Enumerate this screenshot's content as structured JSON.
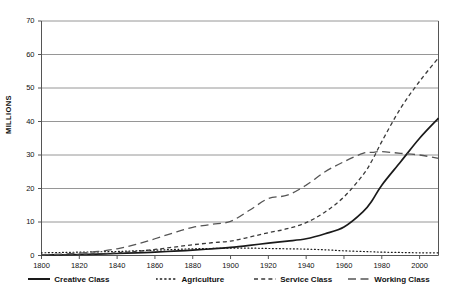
{
  "chart_data": {
    "type": "line",
    "title": "",
    "subtitle": "",
    "xlabel": "",
    "ylabel": "MILLIONS",
    "xlim": [
      1800,
      2010
    ],
    "ylim": [
      0,
      70
    ],
    "grid": true,
    "legend_position": "bottom",
    "xticks": [
      1800,
      1820,
      1840,
      1860,
      1880,
      1900,
      1920,
      1940,
      1960,
      1980,
      2000
    ],
    "yticks": [
      0,
      10,
      20,
      30,
      40,
      50,
      60,
      70
    ],
    "x": [
      1800,
      1810,
      1820,
      1830,
      1840,
      1850,
      1860,
      1870,
      1880,
      1890,
      1900,
      1910,
      1920,
      1930,
      1940,
      1950,
      1960,
      1970,
      1975,
      1980,
      1990,
      2000,
      2010
    ],
    "series": [
      {
        "name": "Creative Class",
        "style": "solid",
        "color": "#1a1a1a",
        "values": [
          0.1,
          0.2,
          0.3,
          0.4,
          0.6,
          0.8,
          1.0,
          1.3,
          1.6,
          2.0,
          2.4,
          3.0,
          3.7,
          4.3,
          5.0,
          6.5,
          8.5,
          13.0,
          16.5,
          21.0,
          28.0,
          35.0,
          41.0
        ]
      },
      {
        "name": "Agriculture",
        "style": "dotted",
        "color": "#1a1a1a",
        "values": [
          0.8,
          0.9,
          1.0,
          1.1,
          1.2,
          1.4,
          1.6,
          1.8,
          2.0,
          2.1,
          2.2,
          2.2,
          2.1,
          2.0,
          1.9,
          1.7,
          1.4,
          1.2,
          1.1,
          1.0,
          0.9,
          0.8,
          0.8
        ]
      },
      {
        "name": "Service Class",
        "style": "dashed-short",
        "color": "#3a3a3a",
        "values": [
          0.1,
          0.2,
          0.3,
          0.5,
          0.8,
          1.2,
          1.8,
          2.5,
          3.2,
          3.8,
          4.3,
          5.5,
          6.8,
          8.0,
          9.8,
          13.0,
          17.5,
          24.0,
          28.5,
          34.0,
          44.0,
          52.0,
          59.0
        ]
      },
      {
        "name": "Working Class",
        "style": "dashed-long",
        "color": "#555555",
        "values": [
          0.2,
          0.4,
          0.7,
          1.2,
          2.0,
          3.3,
          5.0,
          6.8,
          8.4,
          9.3,
          10.2,
          13.5,
          17.0,
          18.0,
          21.0,
          25.0,
          28.0,
          30.5,
          30.8,
          31.0,
          30.5,
          30.0,
          29.0
        ]
      }
    ]
  },
  "legend": {
    "items": [
      {
        "label": "Creative Class",
        "style": "solid"
      },
      {
        "label": "Agriculture",
        "style": "dotted"
      },
      {
        "label": "Service Class",
        "style": "dashed-short"
      },
      {
        "label": "Working Class",
        "style": "dashed-long"
      }
    ]
  },
  "axis": {
    "y_label": "MILLIONS",
    "y_tick_labels": [
      "70",
      "60",
      "50",
      "40",
      "30",
      "20",
      "10",
      "0"
    ],
    "x_tick_labels": [
      "1800",
      "1820",
      "1840",
      "1860",
      "1880",
      "1900",
      "1920",
      "1940",
      "1960",
      "1980",
      "2000"
    ]
  },
  "colors": {
    "grid": "#8a8a8a",
    "axis": "#555555",
    "text": "#111111",
    "background": "#ffffff"
  }
}
